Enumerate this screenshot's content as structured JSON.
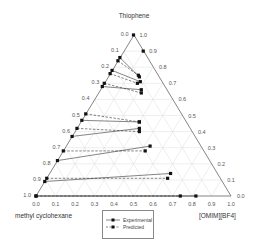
{
  "chart_data": {
    "type": "ternary",
    "title": "",
    "apex_labels": {
      "top": "Thiophene",
      "bottom_left": "methyl cyclohexane",
      "bottom_right": "[OMIM][BF4]"
    },
    "ticks": [
      "0.0",
      "0.1",
      "0.2",
      "0.3",
      "0.4",
      "0.5",
      "0.6",
      "0.7",
      "0.8",
      "0.9",
      "1.0"
    ],
    "grid": true,
    "legend": [
      {
        "name": "Experimental",
        "style": "solid"
      },
      {
        "name": "Predicted",
        "style": "dashed"
      }
    ],
    "legend_position": "bottom-center",
    "series": [
      {
        "name": "Experimental",
        "style": "solid",
        "tie_lines": [
          {
            "raffinate": {
              "thiophene": 0.86,
              "ionic_liquid": 0.0
            },
            "extract": {
              "thiophene": 0.74,
              "ionic_liquid": 0.16
            }
          },
          {
            "raffinate": {
              "thiophene": 0.78,
              "ionic_liquid": 0.0
            },
            "extract": {
              "thiophene": 0.71,
              "ionic_liquid": 0.18
            }
          },
          {
            "raffinate": {
              "thiophene": 0.68,
              "ionic_liquid": 0.0
            },
            "extract": {
              "thiophene": 0.66,
              "ionic_liquid": 0.21
            }
          },
          {
            "raffinate": {
              "thiophene": 0.47,
              "ionic_liquid": 0.0
            },
            "extract": {
              "thiophene": 0.46,
              "ionic_liquid": 0.3
            }
          },
          {
            "raffinate": {
              "thiophene": 0.37,
              "ionic_liquid": 0.0
            },
            "extract": {
              "thiophene": 0.42,
              "ionic_liquid": 0.32
            }
          },
          {
            "raffinate": {
              "thiophene": 0.22,
              "ionic_liquid": 0.0
            },
            "extract": {
              "thiophene": 0.31,
              "ionic_liquid": 0.43
            }
          },
          {
            "raffinate": {
              "thiophene": 0.09,
              "ionic_liquid": 0.0
            },
            "extract": {
              "thiophene": 0.14,
              "ionic_liquid": 0.62
            }
          },
          {
            "raffinate": {
              "thiophene": 0.0,
              "ionic_liquid": 0.0
            },
            "extract": {
              "thiophene": 0.0,
              "ionic_liquid": 0.82
            }
          }
        ]
      },
      {
        "name": "Predicted",
        "style": "dashed",
        "tie_lines": [
          {
            "raffinate": {
              "thiophene": 0.84,
              "ionic_liquid": 0.0
            },
            "extract": {
              "thiophene": 0.75,
              "ionic_liquid": 0.15
            }
          },
          {
            "raffinate": {
              "thiophene": 0.76,
              "ionic_liquid": 0.0
            },
            "extract": {
              "thiophene": 0.7,
              "ionic_liquid": 0.17
            }
          },
          {
            "raffinate": {
              "thiophene": 0.7,
              "ionic_liquid": 0.0
            },
            "extract": {
              "thiophene": 0.64,
              "ionic_liquid": 0.22
            }
          },
          {
            "raffinate": {
              "thiophene": 0.51,
              "ionic_liquid": 0.0
            },
            "extract": {
              "thiophene": 0.46,
              "ionic_liquid": 0.3
            }
          },
          {
            "raffinate": {
              "thiophene": 0.42,
              "ionic_liquid": 0.0
            },
            "extract": {
              "thiophene": 0.4,
              "ionic_liquid": 0.33
            }
          },
          {
            "raffinate": {
              "thiophene": 0.28,
              "ionic_liquid": 0.0
            },
            "extract": {
              "thiophene": 0.28,
              "ionic_liquid": 0.42
            }
          },
          {
            "raffinate": {
              "thiophene": 0.11,
              "ionic_liquid": 0.0
            },
            "extract": {
              "thiophene": 0.11,
              "ionic_liquid": 0.62
            }
          },
          {
            "raffinate": {
              "thiophene": 0.0,
              "ionic_liquid": 0.0
            },
            "extract": {
              "thiophene": 0.0,
              "ionic_liquid": 0.74
            }
          }
        ]
      }
    ],
    "extra_points": [
      {
        "thiophene": 1.0,
        "ionic_liquid": 0.0
      },
      {
        "thiophene": 0.9,
        "ionic_liquid": 0.1
      }
    ]
  },
  "legend": {
    "experimental": "Experimental",
    "predicted": "Predicted"
  },
  "labels": {
    "top": "Thiophene",
    "bottom_left": "methyl cyclohexane",
    "bottom_right": "[OMIM][BF4]"
  }
}
